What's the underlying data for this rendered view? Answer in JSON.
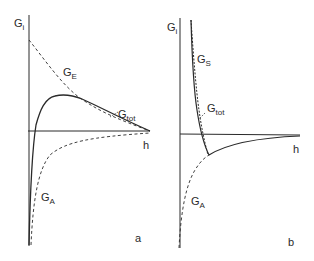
{
  "figure": {
    "panels": [
      {
        "id": "a",
        "letter": "a",
        "y_axis_label": {
          "main": "G",
          "sub": "i"
        },
        "x_axis_label": "h",
        "curves": [
          {
            "name": "G_E",
            "main": "G",
            "sub": "E",
            "style": "dashed"
          },
          {
            "name": "G_tot",
            "main": "G",
            "sub": "tot",
            "style": "solid"
          },
          {
            "name": "G_A",
            "main": "G",
            "sub": "A",
            "style": "dashed"
          }
        ]
      },
      {
        "id": "b",
        "letter": "b",
        "y_axis_label": {
          "main": "G",
          "sub": "i"
        },
        "x_axis_label": "h",
        "curves": [
          {
            "name": "G_S",
            "main": "G",
            "sub": "S",
            "style": "dashed"
          },
          {
            "name": "G_tot",
            "main": "G",
            "sub": "tot",
            "style": "solid"
          },
          {
            "name": "G_A",
            "main": "G",
            "sub": "A",
            "style": "dashed"
          }
        ]
      }
    ],
    "colors": {
      "line": "#2a2a2a",
      "background": "#ffffff"
    }
  }
}
